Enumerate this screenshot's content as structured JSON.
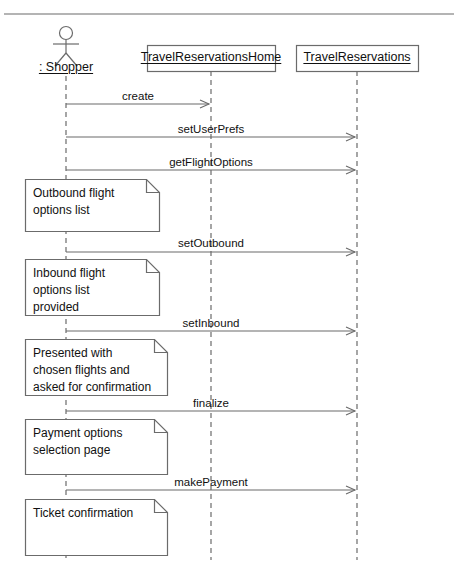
{
  "diagram": {
    "type": "uml-sequence-diagram",
    "top_rule": {
      "x1": 4,
      "x2": 454,
      "y": 14
    },
    "actor": {
      "name": ": Shopper",
      "icon": "stick-figure-actor-icon",
      "x": 66,
      "label_y": 60,
      "lifeline_top": 76,
      "lifeline_bottom": 560
    },
    "lifelines": [
      {
        "id": "travel-reservations-home",
        "label": "TravelReservationsHome",
        "x": 211,
        "box": {
          "x": 147,
          "y": 45,
          "w": 128,
          "h": 26
        },
        "lifeline_top": 71,
        "lifeline_bottom": 560
      },
      {
        "id": "travel-reservations",
        "label": "TravelReservations",
        "x": 357,
        "box": {
          "x": 296,
          "y": 45,
          "w": 122,
          "h": 26
        },
        "lifeline_top": 71,
        "lifeline_bottom": 560
      }
    ],
    "messages": [
      {
        "label": "create",
        "from_x": 66,
        "to_x": 211,
        "y": 104,
        "label_x": 138,
        "label_y": 89
      },
      {
        "label": "setUserPrefs",
        "from_x": 66,
        "to_x": 357,
        "y": 137,
        "label_x": 211,
        "label_y": 122
      },
      {
        "label": "getFlightOptions",
        "from_x": 66,
        "to_x": 357,
        "y": 170,
        "label_x": 211,
        "label_y": 155
      },
      {
        "label": "setOutbound",
        "from_x": 66,
        "to_x": 357,
        "y": 252,
        "label_x": 211,
        "label_y": 236
      },
      {
        "label": "setInbound",
        "from_x": 66,
        "to_x": 357,
        "y": 331,
        "label_x": 211,
        "label_y": 316
      },
      {
        "label": "finalize",
        "from_x": 66,
        "to_x": 357,
        "y": 411,
        "label_x": 211,
        "label_y": 396
      },
      {
        "label": "makePayment",
        "from_x": 66,
        "to_x": 357,
        "y": 490,
        "label_x": 211,
        "label_y": 475
      }
    ],
    "notes": [
      {
        "id": "note-outbound-flight-options",
        "lines": [
          "Outbound flight",
          "options list"
        ],
        "box": {
          "x": 25,
          "y": 179,
          "w": 134,
          "h": 52
        },
        "fold": 13
      },
      {
        "id": "note-inbound-flight-options",
        "lines": [
          "Inbound flight",
          "options list",
          "provided"
        ],
        "box": {
          "x": 25,
          "y": 259,
          "w": 134,
          "h": 56
        },
        "fold": 13
      },
      {
        "id": "note-presented-chosen-flights",
        "lines": [
          "Presented with",
          "chosen flights and",
          "asked for confirmation"
        ],
        "box": {
          "x": 25,
          "y": 339,
          "w": 142,
          "h": 56
        },
        "fold": 13
      },
      {
        "id": "note-payment-options",
        "lines": [
          "Payment options",
          "selection page"
        ],
        "box": {
          "x": 25,
          "y": 419,
          "w": 142,
          "h": 55
        },
        "fold": 13
      },
      {
        "id": "note-ticket-confirmation",
        "lines": [
          "Ticket confirmation"
        ],
        "box": {
          "x": 25,
          "y": 499,
          "w": 142,
          "h": 56
        },
        "fold": 13
      }
    ],
    "colors": {
      "line": "#6b6b6b",
      "box_border": "#6b6b6b",
      "text": "#111111",
      "background": "#ffffff",
      "rule": "#6b6b6b"
    }
  }
}
